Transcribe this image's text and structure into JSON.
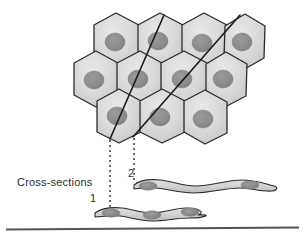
{
  "figure": {
    "title_label": "Cross-sections",
    "width": 305,
    "height": 239,
    "background": "#ffffff",
    "callouts": [
      {
        "id": "1",
        "label": "1"
      },
      {
        "id": "2",
        "label": "2"
      }
    ],
    "colors": {
      "cell_fill": "#d2d2d2",
      "cell_fill_light": "#e2e2e2",
      "cell_outline": "#2b2b2b",
      "nucleus_fill": "#8c8c8c",
      "nucleus_edge": "#7a7a7a",
      "section_line": "#1a1a1a",
      "dotted_line": "#3a3a3a",
      "baseline": "#555555",
      "text": "#2e2e2e"
    },
    "cell_sheet": {
      "rows": [
        {
          "row": 1,
          "count": 4,
          "cells": [
            {
              "cx": 116,
              "cy": 42,
              "nx": 115,
              "ny": 42
            },
            {
              "cx": 160,
              "cy": 42,
              "nx": 157,
              "ny": 41
            },
            {
              "cx": 204,
              "cy": 42,
              "nx": 201,
              "ny": 43
            },
            {
              "cx": 243,
              "cy": 43,
              "nx": 240,
              "ny": 42
            }
          ]
        },
        {
          "row": 2,
          "count": 4,
          "cells": [
            {
              "cx": 96,
              "cy": 79,
              "nx": 94,
              "ny": 80
            },
            {
              "cx": 140,
              "cy": 79,
              "nx": 138,
              "ny": 79
            },
            {
              "cx": 184,
              "cy": 79,
              "nx": 181,
              "ny": 79
            },
            {
              "cx": 225,
              "cy": 80,
              "nx": 222,
              "ny": 79
            }
          ]
        },
        {
          "row": 3,
          "count": 3,
          "cells": [
            {
              "cx": 119,
              "cy": 117,
              "nx": 117,
              "ny": 115
            },
            {
              "cx": 162,
              "cy": 117,
              "nx": 160,
              "ny": 117
            },
            {
              "cx": 204,
              "cy": 118,
              "nx": 202,
              "ny": 119
            }
          ]
        }
      ]
    },
    "section_planes": [
      {
        "id": "1",
        "x1": 164,
        "y1": 15,
        "x2": 110,
        "y2": 139
      },
      {
        "id": "2",
        "x1": 240,
        "y1": 15,
        "x2": 133,
        "y2": 137
      }
    ],
    "drop_lines": [
      {
        "id": "1",
        "x": 110,
        "y1": 139,
        "y2": 212
      },
      {
        "id": "2",
        "x": 134,
        "y1": 137,
        "y2": 182
      }
    ],
    "cross_sections": [
      {
        "id": "1",
        "label": "1",
        "cx": 150,
        "cy": 211,
        "length": 122,
        "nuclei": 3
      },
      {
        "id": "2",
        "label": "2",
        "cx": 200,
        "cy": 184,
        "length": 142,
        "nuclei": 2
      }
    ],
    "baseline": {
      "x1": 6,
      "y1": 229,
      "x2": 299,
      "y2": 227
    }
  }
}
